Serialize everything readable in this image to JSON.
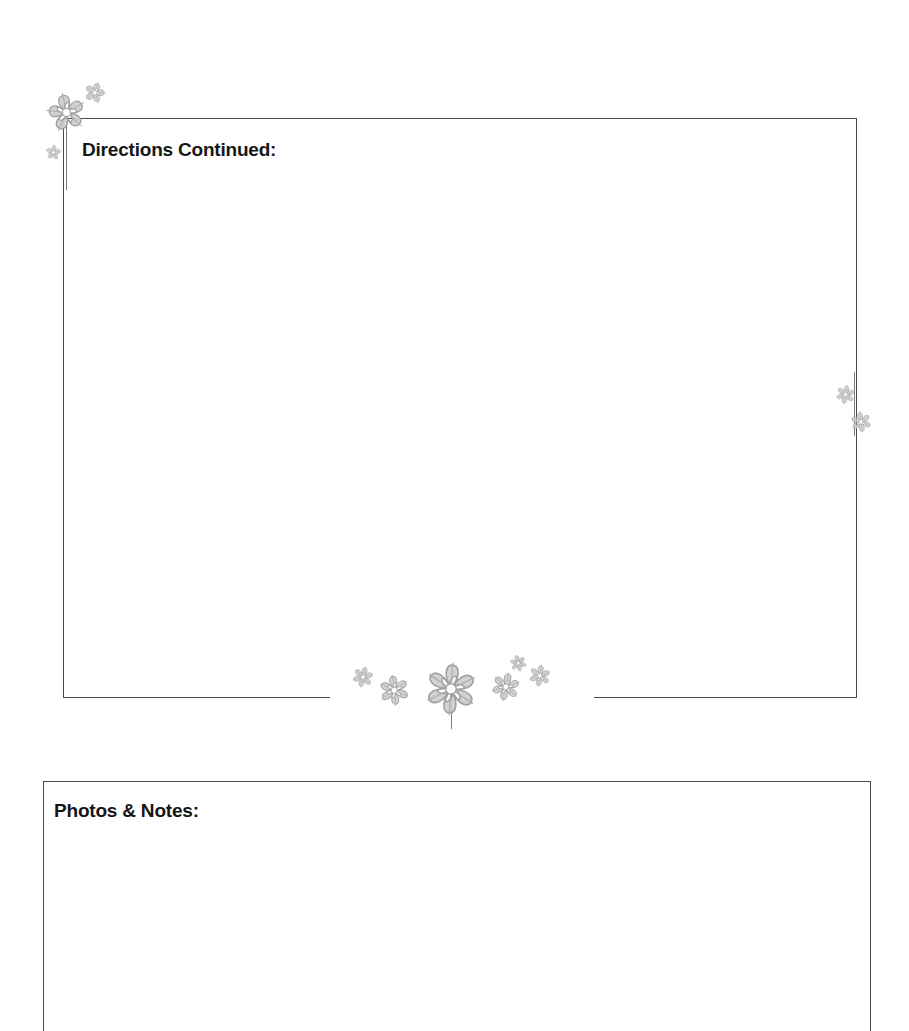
{
  "document": {
    "type": "printable-worksheet-page",
    "page_background": "#ffffff",
    "width": 909,
    "height": 990
  },
  "sections": [
    {
      "id": "directions-continued",
      "heading": "Directions Continued:",
      "heading_position": {
        "x": 82,
        "y": 139
      },
      "heading_font_size_px": 19,
      "box": {
        "x": 63,
        "y": 118,
        "width": 794,
        "height": 580
      },
      "border_color": "#4a4a4a",
      "bottom_border_gap": {
        "start_x": 330,
        "end_x": 594
      },
      "body_text": ""
    },
    {
      "id": "photos-notes",
      "heading": "Photos & Notes:",
      "heading_position": {
        "x": 54,
        "y": 800
      },
      "heading_font_size_px": 19,
      "box": {
        "x": 43,
        "y": 781,
        "width": 828,
        "height": 250
      },
      "border_color": "#4a4a4a",
      "body_text": ""
    }
  ],
  "decorations": {
    "palette": {
      "petal_fill": "#cfcfcf",
      "petal_edge": "#9a9a9a",
      "petal_vein": "#a8a8a8",
      "center": "#ffffff",
      "stem": "#7b7b7b"
    },
    "flowers": [
      {
        "name": "flower-top-left-large",
        "x": 66,
        "y": 112,
        "size": 46,
        "petals": 5,
        "rotation": -12,
        "opacity": 0.95
      },
      {
        "name": "flower-top-left-small",
        "x": 95,
        "y": 93,
        "size": 25,
        "petals": 5,
        "rotation": 18,
        "opacity": 0.9
      },
      {
        "name": "flower-left-border-tiny",
        "x": 53,
        "y": 152,
        "size": 18,
        "petals": 5,
        "rotation": 6,
        "opacity": 0.85
      },
      {
        "name": "flower-right-border-upper",
        "x": 845,
        "y": 394,
        "size": 22,
        "petals": 6,
        "rotation": 10,
        "opacity": 0.85
      },
      {
        "name": "flower-right-border-lower",
        "x": 861,
        "y": 422,
        "size": 24,
        "petals": 6,
        "rotation": -8,
        "opacity": 0.85
      },
      {
        "name": "flower-bottom-cluster-1",
        "x": 363,
        "y": 677,
        "size": 24,
        "petals": 6,
        "rotation": 14,
        "opacity": 0.9
      },
      {
        "name": "flower-bottom-cluster-2",
        "x": 394,
        "y": 690,
        "size": 35,
        "petals": 6,
        "rotation": -6,
        "opacity": 0.9
      },
      {
        "name": "flower-bottom-cluster-3",
        "x": 451,
        "y": 689,
        "size": 60,
        "petals": 6,
        "rotation": 4,
        "opacity": 0.92
      },
      {
        "name": "flower-bottom-cluster-4",
        "x": 506,
        "y": 687,
        "size": 33,
        "petals": 6,
        "rotation": 12,
        "opacity": 0.9
      },
      {
        "name": "flower-bottom-cluster-5",
        "x": 518,
        "y": 663,
        "size": 19,
        "petals": 6,
        "rotation": -14,
        "opacity": 0.88
      },
      {
        "name": "flower-bottom-cluster-6",
        "x": 540,
        "y": 676,
        "size": 25,
        "petals": 6,
        "rotation": 8,
        "opacity": 0.9
      }
    ],
    "stems": [
      {
        "name": "stem-top-left",
        "x": 66,
        "y": 118,
        "height": 72
      },
      {
        "name": "stem-right-border",
        "x": 854,
        "y": 372,
        "height": 64
      },
      {
        "name": "stem-bottom-large",
        "x": 451,
        "y": 689,
        "height": 40
      }
    ]
  }
}
